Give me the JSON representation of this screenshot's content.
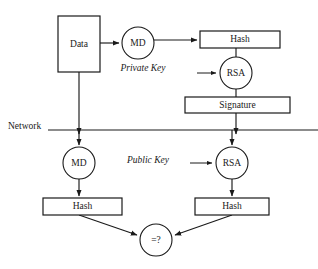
{
  "diagram": {
    "background_color": "#ffffff",
    "stroke_color": "#1a1a1a",
    "network_divider": {
      "label": "Network",
      "label_x": 8,
      "label_y": 127,
      "line_y": 130,
      "line_x1": 48,
      "line_x2": 318
    },
    "nodes": [
      {
        "id": "data-box",
        "label": "Data",
        "shape": "rect",
        "x": 58,
        "y": 16,
        "w": 42,
        "h": 56,
        "cx": 79,
        "cy": 44
      },
      {
        "id": "md-sender",
        "label": "MD",
        "shape": "circle",
        "cx": 138,
        "cy": 43,
        "r": 16
      },
      {
        "id": "hash-sender",
        "label": "Hash",
        "shape": "rect",
        "x": 200,
        "y": 31,
        "w": 80,
        "h": 17,
        "cx": 240,
        "cy": 39.5
      },
      {
        "id": "rsa-sender",
        "label": "RSA",
        "shape": "circle",
        "cx": 236,
        "cy": 73,
        "r": 16
      },
      {
        "id": "signature-box",
        "label": "Signature",
        "shape": "rect",
        "x": 185,
        "y": 97,
        "w": 105,
        "h": 16,
        "cx": 237.5,
        "cy": 105
      },
      {
        "id": "md-receiver",
        "label": "MD",
        "shape": "circle",
        "cx": 79,
        "cy": 163,
        "r": 16
      },
      {
        "id": "rsa-receiver",
        "label": "RSA",
        "shape": "circle",
        "cx": 232,
        "cy": 163,
        "r": 16
      },
      {
        "id": "hash-receiver-left",
        "label": "Hash",
        "shape": "rect",
        "x": 43,
        "y": 198,
        "w": 79,
        "h": 17,
        "cx": 82.5,
        "cy": 206.5
      },
      {
        "id": "hash-receiver-right",
        "label": "Hash",
        "shape": "rect",
        "x": 195,
        "y": 198,
        "w": 74,
        "h": 17,
        "cx": 232,
        "cy": 206.5
      },
      {
        "id": "compare-node",
        "label": "=?",
        "shape": "circle",
        "cx": 156,
        "cy": 240,
        "r": 16
      }
    ],
    "key_labels": [
      {
        "id": "private-key-label",
        "text": "Private Key",
        "x": 143,
        "y": 69
      },
      {
        "id": "public-key-label",
        "text": "Public Key",
        "x": 148,
        "y": 161
      }
    ],
    "edges": [
      {
        "id": "data-to-md-sender",
        "from": "data-box",
        "to": "md-sender",
        "kind": "arrow",
        "path": "M 100 43 L 119 43"
      },
      {
        "id": "md-sender-to-hash-sender",
        "from": "md-sender",
        "to": "hash-sender",
        "kind": "arrow",
        "path": "M 154 40 L 197 40"
      },
      {
        "id": "hash-sender-to-rsa-sender",
        "from": "hash-sender",
        "to": "rsa-sender",
        "kind": "plain",
        "path": "M 236 48 L 236 57"
      },
      {
        "id": "private-key-into-rsa-sender",
        "from": "private-key-label",
        "to": "rsa-sender",
        "kind": "arrow-small",
        "path": "M 197 73 L 216 73"
      },
      {
        "id": "rsa-sender-to-signature",
        "from": "rsa-sender",
        "to": "signature-box",
        "kind": "plain",
        "path": "M 236 89 L 236 97"
      },
      {
        "id": "data-to-network",
        "from": "data-box",
        "to": "md-receiver",
        "kind": "arrow",
        "path": "M 79 72 L 79 134"
      },
      {
        "id": "signature-to-network",
        "from": "signature-box",
        "to": "rsa-receiver",
        "kind": "arrow",
        "path": "M 236 113 L 236 134"
      },
      {
        "id": "network-to-md-receiver",
        "from": "network-divider",
        "to": "md-receiver",
        "kind": "arrow",
        "path": "M 79 130 L 79 145"
      },
      {
        "id": "network-to-rsa-receiver",
        "from": "network-divider",
        "to": "rsa-receiver",
        "kind": "arrow",
        "path": "M 232 130 L 232 145"
      },
      {
        "id": "public-key-into-rsa-receiver",
        "from": "public-key-label",
        "to": "rsa-receiver",
        "kind": "arrow-small",
        "path": "M 190 163 L 212 163"
      },
      {
        "id": "md-receiver-to-hash-left",
        "from": "md-receiver",
        "to": "hash-receiver-left",
        "kind": "arrow",
        "path": "M 79 179 L 79 196"
      },
      {
        "id": "rsa-receiver-to-hash-right",
        "from": "rsa-receiver",
        "to": "hash-receiver-right",
        "kind": "arrow",
        "path": "M 232 179 L 232 196"
      },
      {
        "id": "hash-left-to-compare",
        "from": "hash-receiver-left",
        "to": "compare-node",
        "kind": "arrow",
        "path": "M 79 215 L 137 235"
      },
      {
        "id": "hash-right-to-compare",
        "from": "hash-receiver-right",
        "to": "compare-node",
        "kind": "arrow",
        "path": "M 232 215 L 175 235"
      }
    ]
  }
}
